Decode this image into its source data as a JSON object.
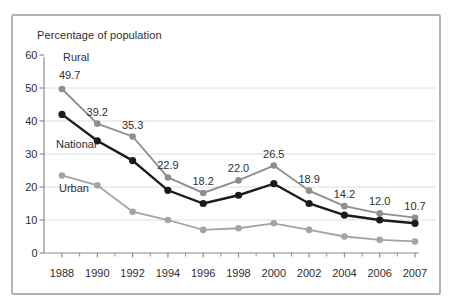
{
  "figure": {
    "title": "Percentage of population",
    "background": "#ffffff",
    "border_color": "#b4b4b4"
  },
  "chart_data": {
    "type": "line",
    "title": "Percentage of population",
    "x_categories": [
      "1988",
      "1990",
      "1992",
      "1994",
      "1996",
      "1998",
      "2000",
      "2002",
      "2004",
      "2006",
      "2007"
    ],
    "ylim": [
      0,
      60
    ],
    "yticks": [
      0,
      10,
      20,
      30,
      40,
      50,
      60
    ],
    "grid": "horizontal",
    "legend_position": "inline-labels-near-series-start",
    "series": [
      {
        "name": "Rural",
        "color": "#8e8e8e",
        "values": [
          49.7,
          39.2,
          35.3,
          22.9,
          18.2,
          22.0,
          26.5,
          18.9,
          14.2,
          12.0,
          10.7
        ],
        "value_labels": [
          "49.7",
          "39.2",
          "35.3",
          "22.9",
          "18.2",
          "22.0",
          "26.5",
          "18.9",
          "14.2",
          "12.0",
          "10.7"
        ],
        "label_pos": {
          "x": 63,
          "y": 61,
          "anchor": "start"
        }
      },
      {
        "name": "National",
        "color": "#1c1c1c",
        "values": [
          42,
          34,
          28,
          19,
          15,
          17.5,
          21,
          15,
          11.5,
          10,
          9
        ],
        "value_labels": [],
        "label_pos": {
          "x": 56,
          "y": 148,
          "anchor": "start"
        }
      },
      {
        "name": "Urban",
        "color": "#a4a4a4",
        "values": [
          23.5,
          20.5,
          12.5,
          10,
          7,
          7.5,
          9,
          7,
          5,
          4,
          3.5
        ],
        "value_labels": [],
        "label_pos": {
          "x": 59,
          "y": 192,
          "anchor": "start"
        }
      }
    ],
    "styles": {
      "grid_color": "#dedede",
      "axis_color": "#8c8c8c",
      "text_color": "#2e2e2e",
      "label_font_size": 11,
      "tick_font_size": 11
    },
    "layout": {
      "x0": 62,
      "dx": 35.3,
      "y_base": 253,
      "y_scale": 3.3,
      "axis_x": 44,
      "axis_top": 57,
      "grid_right": 436,
      "xaxis_right": 419,
      "draw_order": [
        0,
        2,
        1
      ],
      "value_label_overrides": {
        "0": {
          "anchor": "start",
          "dx": -3,
          "dy": -2
        }
      }
    }
  }
}
